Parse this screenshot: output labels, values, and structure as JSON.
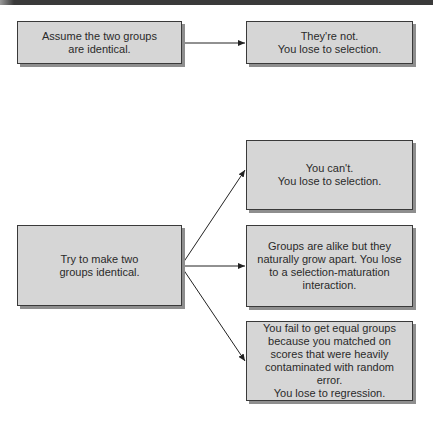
{
  "diagram": {
    "colors": {
      "box_fill": "#d6d6d6",
      "box_border": "#3a3a3a",
      "box_shadow": "#8e8e8e",
      "text": "#2a2a2a",
      "arrow": "#222222",
      "top_bar": "#3a3a3a"
    },
    "boxes": {
      "assume": "Assume the two groups\nare identical.",
      "theyre_not": "They're not.\nYou lose to selection.",
      "try_make": "Try to make two\ngroups identical.",
      "you_cant": "You can't.\nYou lose to selection.",
      "grow_apart": "Groups are alike but they\nnaturally grow apart. You lose\nto a selection-maturation\ninteraction.",
      "regression": "You fail to get equal groups\nbecause you matched on\nscores that were heavily\ncontaminated with random error.\nYou lose to regression."
    },
    "edges": [
      {
        "from": "assume",
        "to": "theyre_not"
      },
      {
        "from": "try_make",
        "to": "you_cant"
      },
      {
        "from": "try_make",
        "to": "grow_apart"
      },
      {
        "from": "try_make",
        "to": "regression"
      }
    ]
  }
}
